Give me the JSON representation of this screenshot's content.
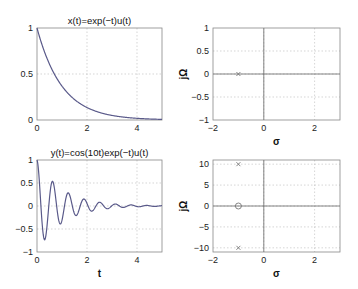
{
  "chart_data": [
    {
      "id": "x-time",
      "type": "line",
      "title": "x(t)=exp(−t)u(t)",
      "xlabel": "",
      "ylabel": "",
      "function": "exp(-t)",
      "xlim": [
        0,
        5
      ],
      "ylim": [
        0,
        1
      ],
      "xticks": [
        0,
        2,
        4
      ],
      "yticks": [
        0,
        0.5,
        1
      ],
      "xtick_labels": [
        "0",
        "2",
        "4"
      ],
      "ytick_labels": [
        "0",
        "0.5",
        "1"
      ],
      "grid": true,
      "series": [
        {
          "name": "x(t)",
          "x": [
            0,
            0.25,
            0.5,
            0.75,
            1,
            1.5,
            2,
            2.5,
            3,
            3.5,
            4,
            4.5,
            5
          ],
          "y": [
            1,
            0.779,
            0.607,
            0.472,
            0.368,
            0.223,
            0.135,
            0.082,
            0.05,
            0.03,
            0.018,
            0.011,
            0.007
          ]
        }
      ]
    },
    {
      "id": "x-pz",
      "type": "scatter",
      "title": "",
      "xlabel": "σ",
      "ylabel": "jΩ",
      "xlim": [
        -2,
        3
      ],
      "ylim": [
        -1,
        1
      ],
      "xticks": [
        -2,
        0,
        2
      ],
      "yticks": [
        -1,
        -0.5,
        0,
        0.5,
        1
      ],
      "xtick_labels": [
        "−2",
        "0",
        "2"
      ],
      "ytick_labels": [
        "−1",
        "−0.5",
        "0",
        "0.5",
        "1"
      ],
      "grid": true,
      "poles": [
        {
          "sigma": -1,
          "omega": 0
        }
      ],
      "zeros": []
    },
    {
      "id": "y-time",
      "type": "line",
      "title": "y(t)=cos(10t)exp(−t)u(t)",
      "xlabel": "t",
      "ylabel": "",
      "function": "cos(10t)exp(-t)",
      "xlim": [
        0,
        5
      ],
      "ylim": [
        -1,
        1
      ],
      "xticks": [
        0,
        2,
        4
      ],
      "yticks": [
        -1,
        -0.5,
        0,
        0.5,
        1
      ],
      "xtick_labels": [
        "0",
        "2",
        "4"
      ],
      "ytick_labels": [
        "−1",
        "−0.5",
        "0",
        "0.5",
        "1"
      ],
      "grid": true,
      "series": [
        {
          "name": "y(t)",
          "x": [
            0,
            0.314,
            0.628,
            0.942,
            1.257,
            1.571,
            1.885,
            2.199,
            2.513,
            2.827,
            3.142,
            5
          ],
          "y": [
            1,
            -0.73,
            0.53,
            -0.39,
            0.28,
            -0.21,
            0.15,
            -0.11,
            0.08,
            -0.06,
            0.04,
            0.002
          ]
        }
      ]
    },
    {
      "id": "y-pz",
      "type": "scatter",
      "title": "",
      "xlabel": "σ",
      "ylabel": "jΩ",
      "xlim": [
        -2,
        3
      ],
      "ylim": [
        -11,
        11
      ],
      "xticks": [
        -2,
        0,
        2
      ],
      "yticks": [
        -10,
        -5,
        0,
        5,
        10
      ],
      "xtick_labels": [
        "−2",
        "0",
        "2"
      ],
      "ytick_labels": [
        "−10",
        "−5",
        "0",
        "5",
        "10"
      ],
      "grid": true,
      "poles": [
        {
          "sigma": -1,
          "omega": 10
        },
        {
          "sigma": -1,
          "omega": -10
        }
      ],
      "zeros": [
        {
          "sigma": -1,
          "omega": 0
        }
      ]
    }
  ]
}
